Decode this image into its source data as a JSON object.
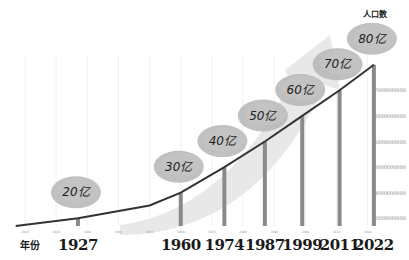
{
  "chart_data": {
    "type": "line",
    "title": "",
    "xlabel": "年份",
    "ylabel": "人口数",
    "x_ticks": [
      "1910",
      "1920",
      "1930",
      "1940",
      "1950",
      "1960",
      "1970",
      "1980",
      "1990",
      "2000",
      "2010",
      "2020"
    ],
    "y_ticks": [
      "2000000000",
      "3000000000",
      "4000000000",
      "5000000000",
      "6000000000",
      "7000000000"
    ],
    "grid": "vertical",
    "milestones": [
      {
        "year": "1927",
        "label": "20亿",
        "value": 2000000000
      },
      {
        "year": "1960",
        "label": "30亿",
        "value": 3000000000
      },
      {
        "year": "1974",
        "label": "40亿",
        "value": 4000000000
      },
      {
        "year": "1987",
        "label": "50亿",
        "value": 5000000000
      },
      {
        "year": "1999",
        "label": "60亿",
        "value": 6000000000
      },
      {
        "year": "2011",
        "label": "70亿",
        "value": 7000000000
      },
      {
        "year": "2022",
        "label": "80亿",
        "value": 8000000000
      }
    ],
    "series": [
      {
        "name": "人口数",
        "x": [
          1907,
          1927,
          1950,
          1960,
          1974,
          1987,
          1999,
          2011,
          2022
        ],
        "values": [
          1700000000,
          2000000000,
          2500000000,
          3000000000,
          4000000000,
          5000000000,
          6000000000,
          7000000000,
          8000000000
        ]
      }
    ],
    "colors": {
      "line": "#333333",
      "bar": "#8a8a8a",
      "bubble": "#b5b5b5",
      "arrow": "#e4e4e4",
      "grid": "#eeeeee"
    }
  }
}
